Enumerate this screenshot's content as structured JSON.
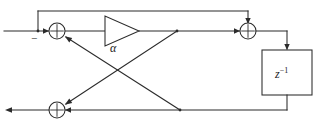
{
  "diagram": {
    "type": "signal-flow-diagram",
    "stroke_color": "#2b2b2b",
    "background_color": "#ffffff",
    "labels": {
      "gain_coefficient": "α",
      "negative_sign": "−",
      "delay_base": "z",
      "delay_exponent": "−1"
    },
    "nodes": [
      {
        "id": "sum-left",
        "name": "left-summing-junction",
        "symbol": "+",
        "x": 57,
        "y": 31
      },
      {
        "id": "gain",
        "name": "gain-triangle",
        "symbol": "α",
        "x": 118,
        "y": 31
      },
      {
        "id": "sum-right",
        "name": "right-summing-junction",
        "symbol": "+",
        "x": 248,
        "y": 31
      },
      {
        "id": "delay",
        "name": "unit-delay-block",
        "symbol": "z^-1",
        "x": 287,
        "y": 76
      },
      {
        "id": "sum-bottom",
        "name": "bottom-summing-junction",
        "symbol": "+",
        "x": 57,
        "y": 110
      }
    ],
    "ports": [
      {
        "id": "input",
        "name": "input-port",
        "x": 4,
        "y": 31
      },
      {
        "id": "output",
        "name": "output-port",
        "x": 4,
        "y": 110
      }
    ],
    "edges": [
      {
        "name": "input-to-left-sum",
        "from": "input",
        "to": "sum-left"
      },
      {
        "name": "top-feedback-to-right-sum",
        "from": "sum-left",
        "to": "sum-right"
      },
      {
        "name": "left-sum-to-gain",
        "from": "sum-left",
        "to": "gain"
      },
      {
        "name": "gain-to-right-sum",
        "from": "gain",
        "to": "sum-right"
      },
      {
        "name": "right-sum-to-delay",
        "from": "sum-right",
        "to": "delay"
      },
      {
        "name": "delay-to-bottom-line",
        "from": "delay",
        "to": "sum-bottom"
      },
      {
        "name": "diagonal-top-tap-to-bottom-sum",
        "from": "gain-output-tap",
        "to": "sum-bottom"
      },
      {
        "name": "diagonal-bottom-tap-to-left-sum",
        "from": "bottom-tap",
        "to": "sum-left"
      },
      {
        "name": "bottom-sum-to-output",
        "from": "sum-bottom",
        "to": "output"
      }
    ]
  }
}
